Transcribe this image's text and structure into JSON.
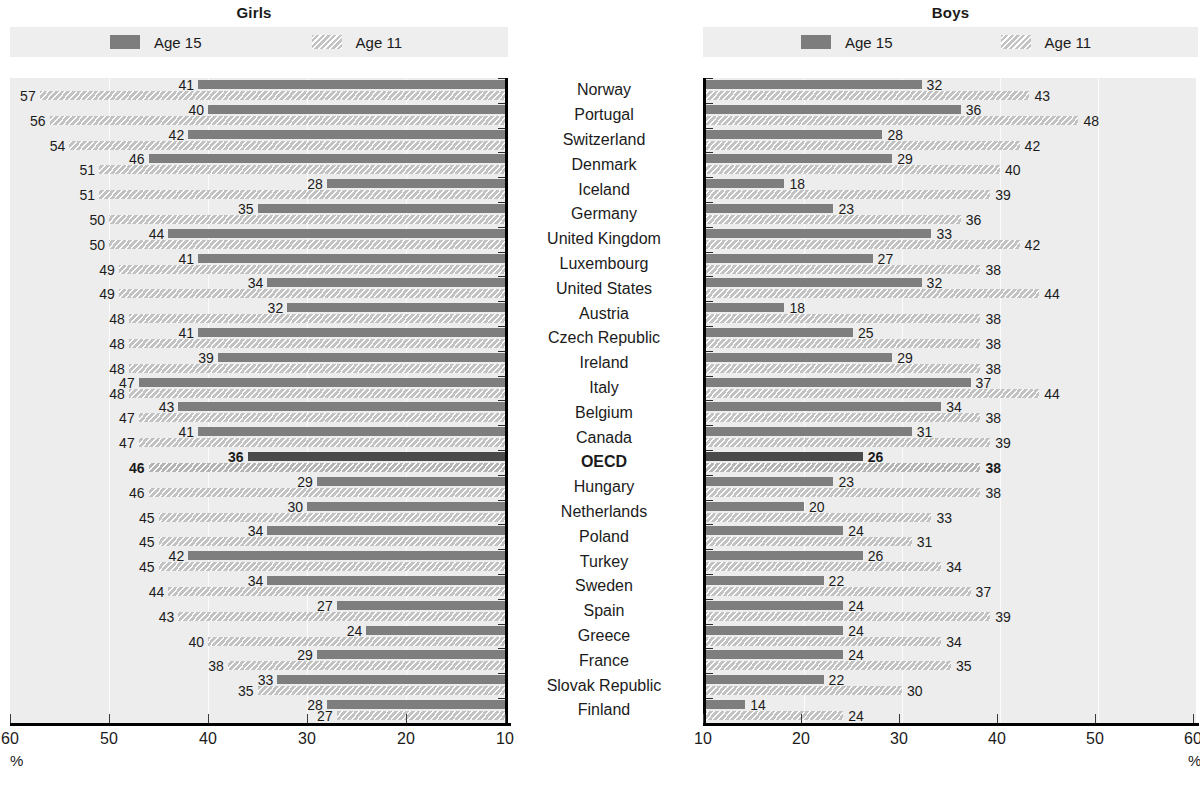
{
  "panels": {
    "girls": {
      "title": "Girls",
      "axis": {
        "ticks": [
          60,
          50,
          40,
          30,
          20,
          10
        ],
        "min": 10,
        "max": 60,
        "reversed": true,
        "unit": "%"
      }
    },
    "boys": {
      "title": "Boys",
      "axis": {
        "ticks": [
          10,
          20,
          30,
          40,
          50,
          60
        ],
        "min": 10,
        "max": 60,
        "reversed": false,
        "unit": "%"
      }
    }
  },
  "legend": {
    "items": [
      {
        "label": "Age 15",
        "swatch": "solid-dark-swatch",
        "color": "#7d7d7d"
      },
      {
        "label": "Age 11",
        "swatch": "hatched-light-swatch",
        "color": "#c3c3c3"
      }
    ]
  },
  "chart_data": {
    "type": "bar",
    "xlabel": "%",
    "ylabel": "",
    "xlim": [
      10,
      60
    ],
    "grid": true,
    "legend_position": "top",
    "categories": [
      "Norway",
      "Portugal",
      "Switzerland",
      "Denmark",
      "Iceland",
      "Germany",
      "United Kingdom",
      "Luxembourg",
      "United States",
      "Austria",
      "Czech Republic",
      "Ireland",
      "Italy",
      "Belgium",
      "Canada",
      "OECD",
      "Hungary",
      "Netherlands",
      "Poland",
      "Turkey",
      "Sweden",
      "Spain",
      "Greece",
      "France",
      "Slovak Republic",
      "Finland"
    ],
    "highlight_category": "OECD",
    "panels": [
      {
        "name": "Girls",
        "axis_reversed": true,
        "series": [
          {
            "name": "Age 15",
            "values": [
              41,
              40,
              42,
              46,
              28,
              35,
              44,
              41,
              34,
              32,
              41,
              39,
              47,
              43,
              41,
              36,
              29,
              30,
              34,
              42,
              34,
              27,
              24,
              29,
              33,
              28
            ]
          },
          {
            "name": "Age 11",
            "values": [
              57,
              56,
              54,
              51,
              51,
              50,
              50,
              49,
              49,
              48,
              48,
              48,
              48,
              47,
              47,
              46,
              46,
              45,
              45,
              45,
              44,
              43,
              40,
              38,
              35,
              27
            ]
          }
        ]
      },
      {
        "name": "Boys",
        "axis_reversed": false,
        "series": [
          {
            "name": "Age 15",
            "values": [
              32,
              36,
              28,
              29,
              18,
              23,
              33,
              27,
              32,
              18,
              25,
              29,
              37,
              34,
              31,
              26,
              23,
              20,
              24,
              26,
              22,
              24,
              24,
              24,
              22,
              14
            ]
          },
          {
            "name": "Age 11",
            "values": [
              43,
              48,
              42,
              40,
              39,
              36,
              42,
              38,
              44,
              38,
              38,
              38,
              44,
              38,
              39,
              38,
              38,
              33,
              31,
              34,
              37,
              39,
              34,
              35,
              30,
              24
            ]
          }
        ]
      }
    ]
  }
}
